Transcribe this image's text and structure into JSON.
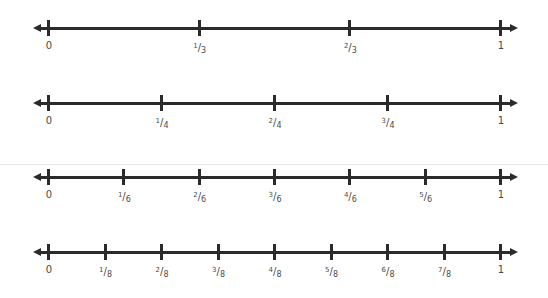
{
  "chart_data": {
    "type": "number-lines",
    "title": "",
    "range": [
      0,
      1
    ],
    "lines": [
      {
        "denominator": 3,
        "labels": [
          "0",
          "1/3",
          "2/3",
          "1"
        ],
        "values": [
          0,
          0.3333,
          0.6667,
          1
        ]
      },
      {
        "denominator": 4,
        "labels": [
          "0",
          "1/4",
          "2/4",
          "3/4",
          "1"
        ],
        "values": [
          0,
          0.25,
          0.5,
          0.75,
          1
        ]
      },
      {
        "denominator": 6,
        "labels": [
          "0",
          "1/6",
          "2/6",
          "3/6",
          "4/6",
          "5/6",
          "1"
        ],
        "values": [
          0,
          0.1667,
          0.3333,
          0.5,
          0.6667,
          0.8333,
          1
        ]
      },
      {
        "denominator": 8,
        "labels": [
          "0",
          "1/8",
          "2/8",
          "3/8",
          "4/8",
          "5/8",
          "6/8",
          "7/8",
          "1"
        ],
        "values": [
          0,
          0.125,
          0.25,
          0.375,
          0.5,
          0.625,
          0.75,
          0.875,
          1
        ]
      }
    ]
  },
  "colors": {
    "line": "#2b2b2b",
    "label": "#4a4a4a",
    "background": "#ffffff"
  },
  "layout": {
    "x0": 48,
    "x1": 500,
    "line_y": [
      28,
      103,
      177,
      252
    ]
  }
}
